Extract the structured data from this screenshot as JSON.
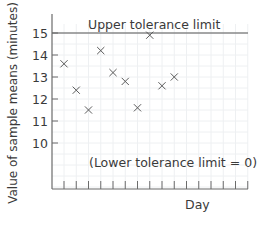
{
  "chart_data": {
    "type": "scatter",
    "title": "",
    "xlabel": "Day",
    "ylabel": "Value of sample means (minutes)",
    "y_ticks": [
      10,
      11,
      12,
      13,
      14,
      15
    ],
    "y_tick_labels": [
      "10",
      "11",
      "12",
      "13",
      "14",
      "15"
    ],
    "ylim": [
      0,
      15.7
    ],
    "x_tick_count": 16,
    "x_tick_labels": [],
    "grid": true,
    "marker": "x",
    "series": [
      {
        "name": "Sample means",
        "x": [
          1,
          2,
          3,
          4,
          5,
          6,
          7,
          8,
          9,
          10
        ],
        "values": [
          13.6,
          12.4,
          11.5,
          14.2,
          13.2,
          12.8,
          11.6,
          14.9,
          12.6,
          13.0
        ]
      }
    ],
    "reference_lines": [
      {
        "name": "upper-tolerance-limit",
        "value": 15,
        "label": "Upper tolerance limit"
      }
    ],
    "annotations": [
      {
        "text": "(Lower tolerance limit = 0)"
      }
    ],
    "colors": {
      "axis": "#6b6b6b",
      "marker": "#5a5a5a",
      "text": "#3a3a3a",
      "grid": "#eef0f2",
      "limit_line": "#555555"
    }
  }
}
